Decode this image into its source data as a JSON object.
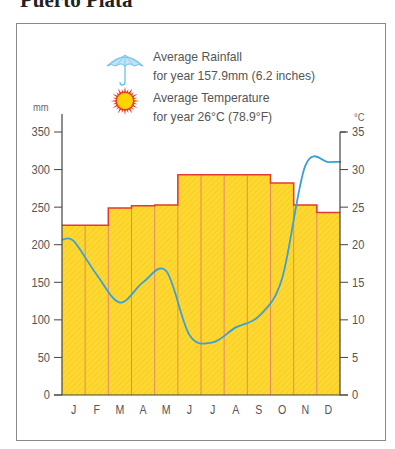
{
  "page": {
    "title": "Puerto Plata"
  },
  "legend": {
    "rainfall_title": "Average Rainfall",
    "rainfall_sub": "for year 157.9mm (6.2 inches)",
    "rainfall_icon": "umbrella-icon",
    "temperature_title": "Average Temperature",
    "temperature_sub": "for year 26°C (78.9°F)",
    "temperature_icon": "sun-icon"
  },
  "axes": {
    "left_unit": "mm",
    "right_unit": "°C",
    "left_ticks": [
      "0",
      "50",
      "100",
      "150",
      "200",
      "250",
      "300",
      "350"
    ],
    "right_ticks": [
      "0",
      "5",
      "10",
      "15",
      "20",
      "25",
      "30",
      "35"
    ]
  },
  "colors": {
    "bar_fill": "#fdd835",
    "bar_stroke": "#e53935",
    "bar_divider": "#e08060",
    "temp_line": "#3aa0d8",
    "axis": "#444444",
    "text": "#555555"
  },
  "chart_data": {
    "type": "bar+line",
    "title": "Puerto Plata",
    "categories": [
      "J",
      "F",
      "M",
      "A",
      "M",
      "J",
      "J",
      "A",
      "S",
      "O",
      "N",
      "D"
    ],
    "series": [
      {
        "name": "Average Rainfall (mm)",
        "type": "bar",
        "axis": "left",
        "values": [
          226,
          226,
          249,
          252,
          253,
          293,
          293,
          293,
          293,
          282,
          253,
          243
        ]
      },
      {
        "name": "Average Temperature (°C)",
        "type": "line",
        "axis": "right",
        "values": [
          20.5,
          16,
          12.3,
          15,
          16.5,
          8,
          7,
          9,
          10.5,
          15.5,
          30.5,
          31
        ]
      }
    ],
    "ylabel_left": "mm",
    "ylabel_right": "°C",
    "ylim_left": [
      0,
      350
    ],
    "ylim_right": [
      0,
      35
    ],
    "grid": false,
    "legend_position": "top",
    "annotations": [
      "Average Rainfall for year 157.9mm (6.2 inches)",
      "Average Temperature for year 26°C (78.9°F)"
    ]
  }
}
